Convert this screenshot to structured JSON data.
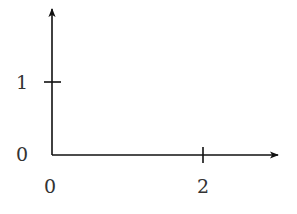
{
  "diagram": {
    "type": "coordinate-axes",
    "x_axis": {
      "ticks": [
        {
          "value": 2,
          "label": "2"
        }
      ],
      "origin_label": "0"
    },
    "y_axis": {
      "ticks": [
        {
          "value": 1,
          "label": "1"
        }
      ],
      "origin_label": "0"
    },
    "line_color": "#111111",
    "label_color": "#333333"
  }
}
